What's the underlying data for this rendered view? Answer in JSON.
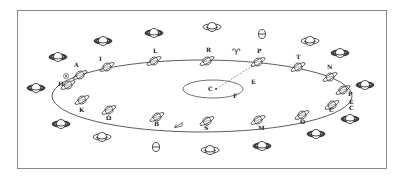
{
  "diagram": {
    "type": "orbital-illustration",
    "border_color": "#8a8a8a",
    "line_color": "#333333",
    "orbit": {
      "cx": 202,
      "cy": 96,
      "rx": 150,
      "ry": 36
    },
    "inner_ellipse": {
      "cx": 213,
      "cy": 89,
      "rx": 30,
      "ry": 9,
      "label": "C"
    },
    "orbit_bodies": [
      {
        "label": "A",
        "x": 80,
        "y": 75,
        "lx": 74,
        "ly": 67
      },
      {
        "label": "H",
        "x": 68,
        "y": 85,
        "lx": 58,
        "ly": 86
      },
      {
        "label": "I",
        "x": 107,
        "y": 67,
        "lx": 99,
        "ly": 61
      },
      {
        "label": "L",
        "x": 154,
        "y": 61,
        "lx": 153,
        "ly": 53
      },
      {
        "label": "R",
        "x": 207,
        "y": 61,
        "lx": 206,
        "ly": 52
      },
      {
        "label": "P",
        "x": 258,
        "y": 62,
        "lx": 257,
        "ly": 53
      },
      {
        "label": "T",
        "x": 298,
        "y": 67,
        "lx": 296,
        "ly": 59
      },
      {
        "label": "N",
        "x": 330,
        "y": 77,
        "lx": 327,
        "ly": 69
      },
      {
        "label": "P",
        "x": 343,
        "y": 90,
        "lx": 348,
        "ly": 96
      },
      {
        "label": "C",
        "x": 332,
        "y": 105,
        "lx": 329,
        "ly": 112
      },
      {
        "label": "O",
        "x": 302,
        "y": 115,
        "lx": 300,
        "ly": 124
      },
      {
        "label": "M",
        "x": 258,
        "y": 120,
        "lx": 258,
        "ly": 130
      },
      {
        "label": "S",
        "x": 207,
        "y": 121,
        "lx": 204,
        "ly": 130
      },
      {
        "label": "B",
        "x": 157,
        "y": 117,
        "lx": 154,
        "ly": 126
      },
      {
        "label": "Ω",
        "x": 109,
        "y": 110,
        "lx": 106,
        "ly": 120
      },
      {
        "label": "K",
        "x": 82,
        "y": 100,
        "lx": 79,
        "ly": 112
      }
    ],
    "orbit_symbols": [
      {
        "label": "♈",
        "x": 232,
        "y": 55
      },
      {
        "label": "Ε",
        "x": 251,
        "y": 84
      },
      {
        "label": "F",
        "x": 233,
        "y": 98
      },
      {
        "label": "E",
        "x": 349,
        "y": 104
      },
      {
        "label": "C",
        "x": 349,
        "y": 110
      }
    ],
    "outer_saturns": [
      {
        "x": 58,
        "y": 57,
        "w": 18,
        "dark": true
      },
      {
        "x": 103,
        "y": 41,
        "w": 18,
        "dark": true
      },
      {
        "x": 154,
        "y": 33,
        "w": 18,
        "dark": true
      },
      {
        "x": 212,
        "y": 27,
        "w": 18,
        "dark": false
      },
      {
        "x": 310,
        "y": 41,
        "w": 18,
        "dark": false
      },
      {
        "x": 340,
        "y": 53,
        "w": 18,
        "dark": true
      },
      {
        "x": 365,
        "y": 85,
        "w": 18,
        "dark": true
      },
      {
        "x": 350,
        "y": 119,
        "w": 18,
        "dark": true
      },
      {
        "x": 316,
        "y": 134,
        "w": 18,
        "dark": true
      },
      {
        "x": 262,
        "y": 146,
        "w": 18,
        "dark": true
      },
      {
        "x": 210,
        "y": 150,
        "w": 18,
        "dark": false
      },
      {
        "x": 61,
        "y": 124,
        "w": 18,
        "dark": true
      },
      {
        "x": 102,
        "y": 137,
        "w": 18,
        "dark": false
      },
      {
        "x": 36,
        "y": 88,
        "w": 18,
        "dark": true
      }
    ],
    "theta_symbols": [
      {
        "x": 262,
        "y": 34
      },
      {
        "x": 156,
        "y": 147
      }
    ],
    "small_marks": [
      {
        "type": "circle-dot",
        "x": 66,
        "y": 76
      },
      {
        "type": "comet",
        "x": 179,
        "y": 125
      }
    ],
    "dashed_line": {
      "x1": 216,
      "y1": 89,
      "x2": 257,
      "y2": 63
    }
  }
}
